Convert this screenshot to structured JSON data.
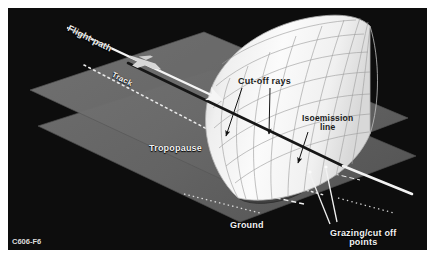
{
  "figure": {
    "code": "C606-F6",
    "background_color": "#0d0d0d",
    "border_color": "#ffffff",
    "plane_color": "#6e6e6e",
    "plane_color_dark": "#5a5a5a",
    "cone_color": "#f4f4f4",
    "cone_grid_color": "#9a9a9a",
    "line_white": "#f5f5f5",
    "line_dark": "#161616"
  },
  "labels": {
    "flight_path": "Flight path",
    "track": "Track",
    "cut_off_rays": "Cut-off rays",
    "isoemission_line_1": "Isoemission",
    "isoemission_line_2": "line",
    "tropopause": "Tropopause",
    "ground": "Ground",
    "grazing_line_1": "Grazing/cut off",
    "grazing_line_2": "points"
  },
  "elements": {
    "aircraft_icon": "aircraft-silhouette-icon",
    "flight_path_arrow": "flight-path-arrow",
    "track_dotted": "track-dotted-line",
    "mach_cone": "mach-cone-mesh",
    "isoemission": "isoemission-line",
    "ground_footprint": "ground-footprint-ellipse",
    "tropopause_plane": "tropopause-plane",
    "ground_plane": "ground-plane",
    "cutoff_ray_arrow_left": "cutoff-ray-leader-left",
    "cutoff_ray_arrow_right": "cutoff-ray-leader-right",
    "isoemission_leader": "isoemission-leader",
    "grazing_leader": "grazing-points-leader"
  }
}
